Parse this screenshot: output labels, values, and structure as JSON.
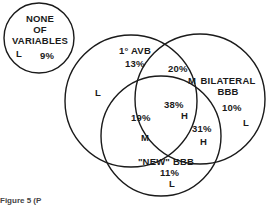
{
  "diagram": {
    "type": "venn",
    "sets": [
      {
        "id": "none",
        "label_lines": [
          "NONE",
          "OF",
          "VARIABLES"
        ],
        "percent": "9%",
        "risk": "L"
      },
      {
        "id": "avb",
        "label": "1° AVB",
        "percent": "13%",
        "risk": "L"
      },
      {
        "id": "bilateral",
        "label_lines": [
          "BILATERAL",
          "BBB"
        ],
        "percent": "10%",
        "risk": "L"
      },
      {
        "id": "new",
        "label": "\"NEW\" BBB",
        "percent": "11%",
        "risk": "L"
      }
    ],
    "intersections": [
      {
        "sets": [
          "avb",
          "bilateral"
        ],
        "percent": "20%",
        "risk": "M"
      },
      {
        "sets": [
          "avb",
          "new"
        ],
        "percent": "19%",
        "risk": "M"
      },
      {
        "sets": [
          "bilateral",
          "new"
        ],
        "percent": "31%",
        "risk": "H"
      },
      {
        "sets": [
          "avb",
          "bilateral",
          "new"
        ],
        "percent": "38%",
        "risk": "H"
      }
    ],
    "caption": "Figure 5 (P"
  }
}
